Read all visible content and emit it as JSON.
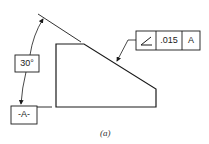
{
  "figure": {
    "caption": "(a)",
    "angle_dimension": "30°",
    "datum_label": "-A-",
    "feature_control_frame": {
      "symbol": "angularity-icon",
      "tolerance": ".015",
      "datum_reference": "A"
    }
  },
  "colors": {
    "line": "#1a1a1a",
    "background": "#ffffff"
  }
}
